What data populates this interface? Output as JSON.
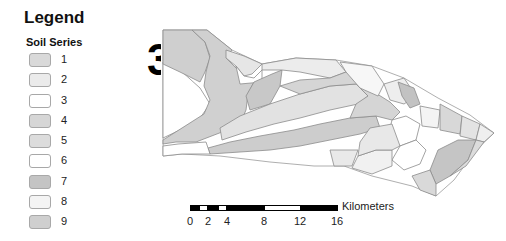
{
  "legend": {
    "title": "Legend",
    "subtitle": "Soil Series",
    "items": [
      {
        "label": "1",
        "color": "#d9d9d9"
      },
      {
        "label": "2",
        "color": "#ebebeb"
      },
      {
        "label": "3",
        "color": "#ffffff"
      },
      {
        "label": "4",
        "color": "#d6d6d6"
      },
      {
        "label": "5",
        "color": "#dcdcdc"
      },
      {
        "label": "6",
        "color": "#ffffff"
      },
      {
        "label": "7",
        "color": "#c4c4c4"
      },
      {
        "label": "8",
        "color": "#f4f4f4"
      },
      {
        "label": "9",
        "color": "#cfcfcf"
      }
    ]
  },
  "north_arrow": {
    "glyph": "3"
  },
  "scalebar": {
    "unit": "Kilometers",
    "ticks": [
      "0",
      "2",
      "4",
      "8",
      "12",
      "16"
    ]
  },
  "map": {
    "polygon_outline": "#8c8c8c",
    "boundary_outline": "#9a9a9a"
  }
}
